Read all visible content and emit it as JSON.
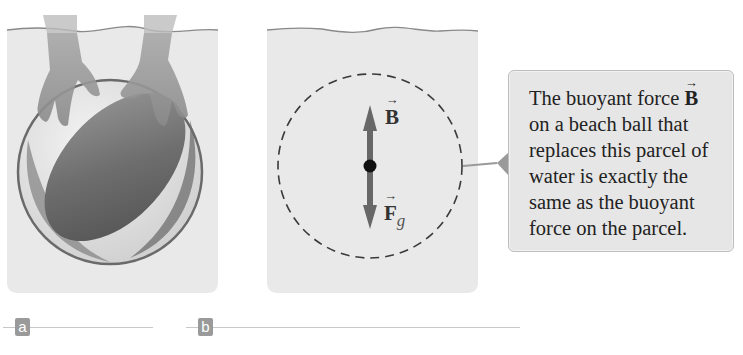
{
  "panels": [
    {
      "id": "a",
      "label": "a",
      "description": "Hands pushing a beach ball under water"
    },
    {
      "id": "b",
      "label": "b",
      "description": "Parcel of water (dashed circle) with force vectors",
      "vectors": {
        "up": {
          "symbol": "B",
          "subscript": ""
        },
        "down": {
          "symbol": "F",
          "subscript": "g"
        }
      }
    }
  ],
  "callout": {
    "text_before": "The buoyant force ",
    "vector_symbol": "B",
    "text_after": " on a beach ball that replaces this parcel of water is exactly the same as the buoyant force on the parcel."
  },
  "colors": {
    "water": "#e8e8e8",
    "water_line": "#8a8a8a",
    "arrow": "#666666",
    "callout_bg": "#e6e6e6",
    "label_tag": "#9a9a9a"
  }
}
